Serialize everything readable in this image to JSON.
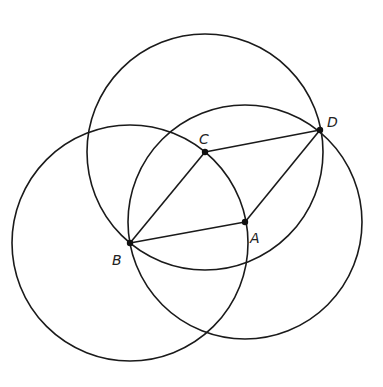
{
  "diagram": {
    "type": "geometric-construction",
    "stroke_color": "#1a1a1a",
    "points": {
      "A": {
        "label": "A",
        "x": 245,
        "y": 222,
        "label_x": 250,
        "label_y": 243
      },
      "B": {
        "label": "B",
        "x": 130,
        "y": 243,
        "label_x": 112,
        "label_y": 265
      },
      "C": {
        "label": "C",
        "x": 205,
        "y": 152,
        "label_x": 199,
        "label_y": 144
      },
      "D": {
        "label": "D",
        "x": 320,
        "y": 130,
        "label_x": 327,
        "label_y": 127
      }
    },
    "circles": [
      {
        "center": "C",
        "through": [
          "B",
          "D"
        ],
        "cx": 205,
        "cy": 152,
        "r": 118
      },
      {
        "center": "B",
        "through": [
          "C",
          "A"
        ],
        "cx": 130,
        "cy": 243,
        "r": 118
      },
      {
        "center": "A",
        "through": [
          "B",
          "D"
        ],
        "cx": 245,
        "cy": 222,
        "r": 117
      }
    ],
    "segments": [
      {
        "from": "B",
        "to": "C"
      },
      {
        "from": "C",
        "to": "D"
      },
      {
        "from": "D",
        "to": "A"
      },
      {
        "from": "A",
        "to": "B"
      }
    ]
  }
}
